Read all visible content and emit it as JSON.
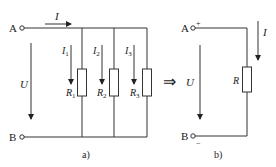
{
  "diagram_a": {
    "terminal_top": "A",
    "terminal_bottom": "B",
    "total_current": "I",
    "voltage": "U",
    "branches": [
      {
        "current": "I",
        "current_sub": "1",
        "resistor": "R",
        "resistor_sub": "1"
      },
      {
        "current": "I",
        "current_sub": "2",
        "resistor": "R",
        "resistor_sub": "2"
      },
      {
        "current": "I",
        "current_sub": "3",
        "resistor": "R",
        "resistor_sub": "3"
      }
    ],
    "caption": "a)"
  },
  "equivalence_arrow": "⇒",
  "diagram_b": {
    "terminal_top": "A",
    "terminal_bottom": "B",
    "plus": "+",
    "minus": "−",
    "current": "I",
    "voltage": "U",
    "resistor": "R",
    "caption": "b)"
  }
}
